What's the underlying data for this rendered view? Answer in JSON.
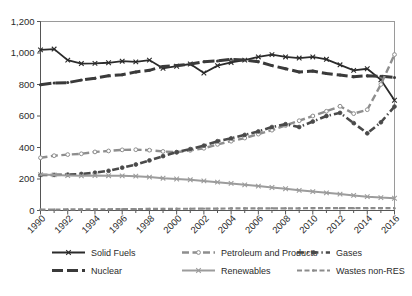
{
  "chart_data": {
    "type": "line",
    "title": "",
    "subtitle": "",
    "xlabel": "",
    "ylabel": "",
    "grid": false,
    "legend_position": "bottom",
    "ylim": [
      0,
      1200
    ],
    "yticks": [
      0,
      200,
      400,
      600,
      800,
      1000,
      1200
    ],
    "ytick_labels": [
      "0",
      "200",
      "400",
      "600",
      "800",
      "1,000",
      "1,200"
    ],
    "x": [
      1990,
      1991,
      1992,
      1993,
      1994,
      1995,
      1996,
      1997,
      1998,
      1999,
      2000,
      2001,
      2002,
      2003,
      2004,
      2005,
      2006,
      2007,
      2008,
      2009,
      2010,
      2011,
      2012,
      2013,
      2014,
      2015,
      2016
    ],
    "xtick_labels": [
      "1990",
      "1992",
      "1994",
      "1996",
      "1998",
      "2000",
      "2002",
      "2004",
      "2006",
      "2008",
      "2010",
      "2012",
      "2014",
      "2016"
    ],
    "xtick_values": [
      1990,
      1992,
      1994,
      1996,
      1998,
      2000,
      2002,
      2004,
      2006,
      2008,
      2010,
      2012,
      2014,
      2016
    ],
    "series": [
      {
        "name": "Solid Fuels",
        "color": "#2b2b2b",
        "marker": "x",
        "dash": "solid",
        "width": 1.8,
        "values": [
          1020,
          1025,
          955,
          933,
          934,
          938,
          948,
          944,
          955,
          903,
          916,
          930,
          873,
          920,
          940,
          955,
          975,
          990,
          975,
          968,
          975,
          960,
          925,
          890,
          900,
          830,
          700
        ]
      },
      {
        "name": "Nuclear",
        "color": "#3a3a3a",
        "marker": "arrow",
        "dash": "longdash",
        "width": 3.0,
        "values": [
          798,
          810,
          812,
          828,
          840,
          855,
          862,
          880,
          890,
          915,
          920,
          930,
          945,
          950,
          960,
          955,
          945,
          920,
          900,
          880,
          885,
          870,
          860,
          850,
          855,
          852,
          845
        ]
      },
      {
        "name": "Petroleum and Products",
        "color": "#8e8e8e",
        "marker": "circle",
        "dash": "dash",
        "width": 2.4,
        "values": [
          335,
          348,
          355,
          360,
          372,
          378,
          385,
          386,
          383,
          375,
          370,
          382,
          395,
          420,
          440,
          460,
          485,
          510,
          540,
          570,
          600,
          630,
          662,
          615,
          640,
          800,
          990
        ]
      },
      {
        "name": "Gases",
        "color": "#4a4a4a",
        "marker": "circle-dot",
        "dash": "dashdot",
        "width": 2.6,
        "values": [
          225,
          226,
          228,
          232,
          240,
          252,
          272,
          292,
          318,
          345,
          370,
          390,
          412,
          440,
          458,
          480,
          502,
          530,
          548,
          530,
          565,
          600,
          620,
          555,
          490,
          560,
          660
        ]
      },
      {
        "name": "Renewables",
        "color": "#9c9c9c",
        "marker": "x",
        "dash": "solid-light",
        "width": 2.0,
        "values": [
          228,
          226,
          222,
          220,
          222,
          221,
          220,
          218,
          212,
          205,
          200,
          195,
          188,
          180,
          172,
          163,
          155,
          146,
          138,
          128,
          120,
          112,
          104,
          96,
          88,
          82,
          78
        ]
      },
      {
        "name": "Wastes non-RES",
        "color": "#8b8b8b",
        "marker": "dot",
        "dash": "dash-short",
        "width": 2.2,
        "values": [
          6,
          6,
          7,
          7,
          8,
          8,
          9,
          9,
          10,
          10,
          11,
          11,
          12,
          12,
          13,
          13,
          13,
          14,
          14,
          14,
          15,
          15,
          15,
          15,
          15,
          15,
          15
        ]
      }
    ]
  },
  "legend": {
    "items": [
      {
        "label": "Solid Fuels",
        "name": "legend-item-solid-fuels"
      },
      {
        "label": "Petroleum and Products",
        "name": "legend-item-petroleum"
      },
      {
        "label": "Gases",
        "name": "legend-item-gases"
      },
      {
        "label": "Nuclear",
        "name": "legend-item-nuclear"
      },
      {
        "label": "Renewables",
        "name": "legend-item-renewables"
      },
      {
        "label": "Wastes non-RES",
        "name": "legend-item-wastes"
      }
    ]
  },
  "colors": {
    "background": "#ffffff",
    "frame": "#9a9a9a",
    "axis": "#555555",
    "text": "#2b2b2b"
  }
}
